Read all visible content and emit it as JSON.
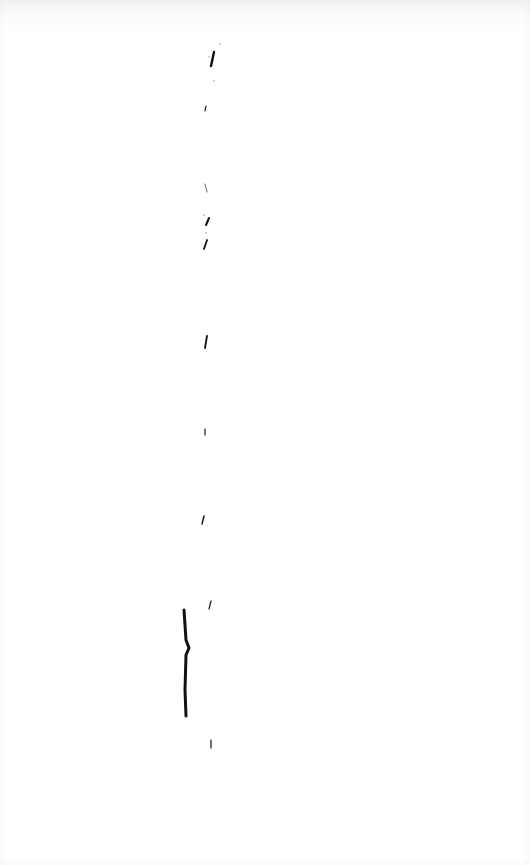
{
  "document": {
    "type": "scanned-page",
    "description": "Mostly blank scanned page with faint scattered ink marks",
    "background_color": "#ffffff",
    "ink_color": "#111111",
    "marks": [
      {
        "id": "mark-1",
        "x": 214,
        "y": 58,
        "d": "M214 52 L211 66"
      },
      {
        "id": "mark-2",
        "x": 205,
        "y": 108,
        "d": "M206 106 L205 111"
      },
      {
        "id": "mark-3",
        "x": 206,
        "y": 188,
        "d": "M205 184 L207 192"
      },
      {
        "id": "mark-4",
        "x": 208,
        "y": 222,
        "d": "M209 218 L206 225"
      },
      {
        "id": "mark-5",
        "x": 206,
        "y": 245,
        "d": "M207 240 L204 249"
      },
      {
        "id": "mark-6",
        "x": 206,
        "y": 342,
        "d": "M207 336 L205 348"
      },
      {
        "id": "mark-7",
        "x": 205,
        "y": 432,
        "d": "M205 429 L205 435"
      },
      {
        "id": "mark-8",
        "x": 203,
        "y": 520,
        "d": "M204 516 L202 524"
      },
      {
        "id": "mark-9",
        "x": 210,
        "y": 605,
        "d": "M211 601 L209 609"
      },
      {
        "id": "mark-10",
        "x": 186,
        "y": 660,
        "d": "M184 610 L186 640 L189 648 L186 655 L185 690 L186 716"
      },
      {
        "id": "mark-11",
        "x": 211,
        "y": 744,
        "d": "M211 740 L211 748"
      }
    ]
  }
}
